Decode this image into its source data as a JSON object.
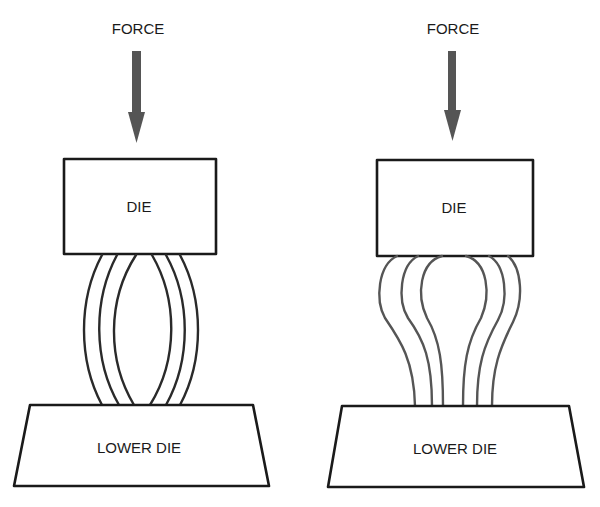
{
  "diagram": {
    "panels": [
      {
        "id": "left",
        "state": "barreled",
        "force_label": "FORCE",
        "upper_die_label": "DIE",
        "lower_die_label": "LOWER DIE",
        "fiber_count": 6
      },
      {
        "id": "right",
        "state": "bulged-top",
        "force_label": "FORCE",
        "upper_die_label": "DIE",
        "lower_die_label": "LOWER DIE",
        "fiber_count": 6
      }
    ],
    "colors": {
      "line": "#1a1a1a",
      "arrow": "#555555",
      "background": "#ffffff"
    }
  }
}
